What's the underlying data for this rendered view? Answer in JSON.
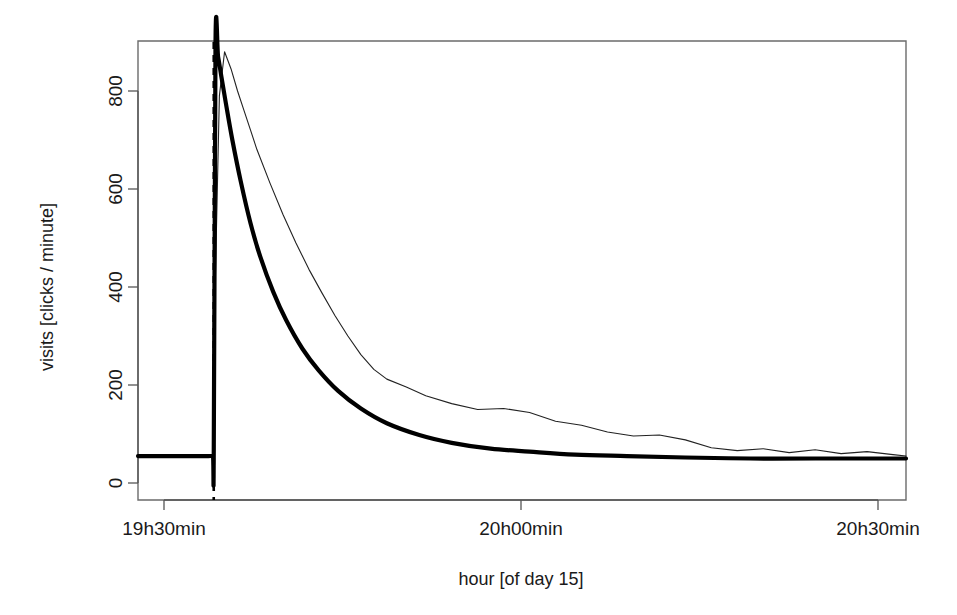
{
  "chart_data": {
    "type": "line",
    "title": "",
    "subtitle": "",
    "xlabel": "hour [of day 15]",
    "ylabel": "visits [clicks / minute]",
    "xlim": [
      19.4166,
      20.6
    ],
    "ylim": [
      -30,
      930
    ],
    "grid": false,
    "legend": "none",
    "x_tick_labels": [
      "19h30min",
      "20h00min",
      "20h30min"
    ],
    "x_tick_values": [
      19.5,
      20.0,
      20.5
    ],
    "y_tick_labels": [
      "0",
      "200",
      "400",
      "600",
      "800"
    ],
    "y_tick_values": [
      0,
      200,
      400,
      600,
      800
    ],
    "annotations": [
      {
        "name": "event-time-marker",
        "type": "vertical-dashed-line",
        "x": 19.5333,
        "label": ""
      }
    ],
    "series": [
      {
        "name": "empirical visits",
        "style": "thin-line",
        "color": "#222222",
        "x": [
          19.4166,
          19.45,
          19.48,
          19.505,
          19.52,
          19.528,
          19.532,
          19.5333,
          19.536,
          19.542,
          19.55,
          19.56,
          19.57,
          19.58,
          19.59,
          19.6,
          19.62,
          19.64,
          19.66,
          19.68,
          19.7,
          19.72,
          19.74,
          19.76,
          19.78,
          19.8,
          19.83,
          19.86,
          19.9,
          19.94,
          19.98,
          20.02,
          20.06,
          20.1,
          20.14,
          20.18,
          20.22,
          20.26,
          20.3,
          20.34,
          20.38,
          20.42,
          20.46,
          20.5,
          20.54,
          20.58,
          20.6
        ],
        "y": [
          55,
          55,
          55,
          55,
          56,
          56,
          57,
          60,
          430,
          790,
          880,
          845,
          800,
          760,
          720,
          680,
          612,
          548,
          490,
          436,
          388,
          342,
          300,
          262,
          232,
          212,
          196,
          178,
          162,
          150,
          152,
          144,
          126,
          118,
          104,
          96,
          98,
          88,
          72,
          66,
          70,
          62,
          68,
          60,
          64,
          58,
          55
        ]
      },
      {
        "name": "fitted exponential decay",
        "style": "thick-line",
        "color": "#000000",
        "x": [
          19.4166,
          19.46,
          19.5,
          19.525,
          19.532,
          19.5333,
          19.536,
          19.54,
          19.545,
          19.552,
          19.562,
          19.575,
          19.59,
          19.605,
          19.625,
          19.645,
          19.67,
          19.695,
          19.725,
          19.76,
          19.8,
          19.85,
          19.9,
          19.96,
          20.02,
          20.09,
          20.17,
          20.26,
          20.36,
          20.46,
          20.54,
          20.6
        ],
        "y": [
          55,
          55,
          55,
          55,
          56,
          57,
          895,
          870,
          830,
          775,
          700,
          615,
          530,
          462,
          390,
          332,
          274,
          230,
          188,
          152,
          122,
          98,
          82,
          70,
          64,
          58,
          55,
          52,
          50,
          50,
          50,
          50
        ]
      }
    ]
  },
  "axes": {
    "x_title": "hour [of day 15]",
    "y_title": "visits [clicks / minute]"
  },
  "colors": {
    "empirical": "#222222",
    "fitted": "#000000",
    "axis": "#555555",
    "background": "#ffffff"
  }
}
